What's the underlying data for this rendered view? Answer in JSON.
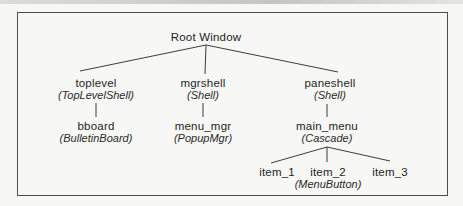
{
  "diagram": {
    "root": {
      "name": "Root Window"
    },
    "nodes": {
      "toplevel": {
        "name": "toplevel",
        "class": "(TopLevelShell)"
      },
      "mgrshell": {
        "name": "mgrshell",
        "class": "(Shell)"
      },
      "paneshell": {
        "name": "paneshell",
        "class": "(Shell)"
      },
      "bboard": {
        "name": "bboard",
        "class": "(BulletinBoard)"
      },
      "menu_mgr": {
        "name": "menu_mgr",
        "class": "(PopupMgr)"
      },
      "main_menu": {
        "name": "main_menu",
        "class": "(Cascade)"
      },
      "item_1": {
        "name": "item_1"
      },
      "item_2": {
        "name": "item_2",
        "class": "(MenuButton)"
      },
      "item_3": {
        "name": "item_3"
      }
    },
    "colors": {
      "line": "#3d3d3d",
      "text": "#1e1e1e",
      "frame_border": "#4c4c4c",
      "background": "#f7f7f5"
    }
  }
}
